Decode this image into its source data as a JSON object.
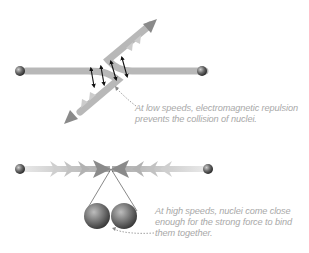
{
  "figure": {
    "top_panel": {
      "name": "low-speed-encounter",
      "annotation": "At low speeds, electromagnetic repulsion prevents the collision of nuclei."
    },
    "bottom_panel": {
      "name": "high-speed-fusion",
      "annotation": "At high speeds, nuclei come close enough for the strong force to bind them together."
    },
    "caption_partial": "Figure 14.6 (partially visible, cut off)"
  },
  "colors": {
    "track": "#b5b5b5",
    "arrow": "#8a8a8a",
    "chevron": "#c4c4c4",
    "nucleus": "#5a5a5a",
    "annotation_text": "#a8a8a8"
  },
  "icons": [
    "nucleus-sphere-icon",
    "repulsion-arrow-icon",
    "dotted-pointer-icon"
  ]
}
